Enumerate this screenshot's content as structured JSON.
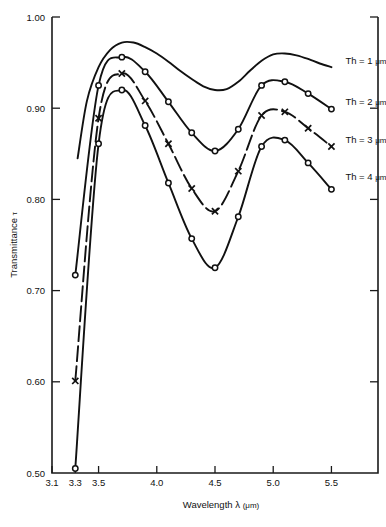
{
  "chart_data": {
    "type": "line",
    "title": "",
    "xlabel": "Wavelength λ (μm)",
    "ylabel": "Transmittance τ",
    "xlim": [
      3.1,
      5.9
    ],
    "ylim": [
      0.5,
      1.0
    ],
    "xticks": [
      3.1,
      3.3,
      3.5,
      4.0,
      4.5,
      5.0,
      5.5
    ],
    "xtick_labels": [
      "3.1",
      "3.3",
      "3.5",
      "4.0",
      "4.5",
      "5.0",
      "5.5"
    ],
    "yticks": [
      0.5,
      0.6,
      0.7,
      0.8,
      0.9,
      1.0
    ],
    "ytick_labels": [
      "0.50",
      "0.60",
      "0.70",
      "0.80",
      "0.90",
      "1.00"
    ],
    "grid": false,
    "legend_position": "right-inline",
    "series": [
      {
        "name": "Th = 1 μm",
        "marker": "none",
        "dash": false,
        "label": "Th = 1 μm",
        "label_at": [
          5.62,
          0.948
        ],
        "x": [
          3.32,
          3.4,
          3.5,
          3.6,
          3.7,
          3.8,
          3.9,
          4.0,
          4.1,
          4.2,
          4.3,
          4.4,
          4.5,
          4.6,
          4.7,
          4.8,
          4.9,
          5.0,
          5.1,
          5.2,
          5.3,
          5.4,
          5.5
        ],
        "y": [
          0.845,
          0.908,
          0.945,
          0.964,
          0.972,
          0.972,
          0.967,
          0.96,
          0.951,
          0.941,
          0.932,
          0.924,
          0.92,
          0.921,
          0.929,
          0.941,
          0.952,
          0.959,
          0.96,
          0.958,
          0.954,
          0.949,
          0.945
        ]
      },
      {
        "name": "Th = 2 μm",
        "marker": "circle",
        "dash": false,
        "label": "Th = 2 μm",
        "label_at": [
          5.62,
          0.903
        ],
        "x": [
          3.3,
          3.5,
          3.7,
          3.9,
          4.1,
          4.3,
          4.5,
          4.7,
          4.9,
          5.1,
          5.3,
          5.5
        ],
        "y": [
          0.717,
          0.925,
          0.956,
          0.94,
          0.907,
          0.873,
          0.853,
          0.877,
          0.925,
          0.929,
          0.916,
          0.899
        ]
      },
      {
        "name": "Th = 3 μm",
        "marker": "cross",
        "dash": true,
        "label": "Th = 3 μm",
        "label_at": [
          5.62,
          0.862
        ],
        "x": [
          3.3,
          3.5,
          3.7,
          3.9,
          4.1,
          4.3,
          4.5,
          4.7,
          4.9,
          5.1,
          5.3,
          5.5
        ],
        "y": [
          0.601,
          0.889,
          0.938,
          0.908,
          0.861,
          0.812,
          0.787,
          0.831,
          0.892,
          0.896,
          0.878,
          0.858
        ]
      },
      {
        "name": "Th = 4 μm",
        "marker": "circle",
        "dash": false,
        "label": "Th = 4 μm",
        "label_at": [
          5.62,
          0.821
        ],
        "x": [
          3.3,
          3.5,
          3.7,
          3.9,
          4.1,
          4.3,
          4.5,
          4.7,
          4.9,
          5.1,
          5.3,
          5.5
        ],
        "y": [
          0.505,
          0.861,
          0.92,
          0.881,
          0.818,
          0.757,
          0.725,
          0.781,
          0.858,
          0.865,
          0.84,
          0.811
        ]
      }
    ]
  },
  "axis": {
    "x_title_text": "Wavelength",
    "x_title_sym": "λ",
    "x_title_unit": "(μm)",
    "y_title_text": "Transmittance",
    "y_title_sym": "τ"
  }
}
